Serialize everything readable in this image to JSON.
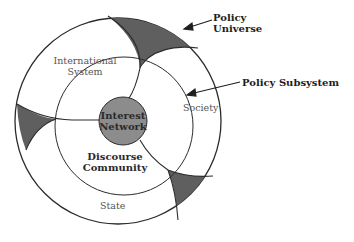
{
  "diagram": {
    "type": "nested-circles",
    "colors": {
      "background": "#ffffff",
      "line": "#2b2b2b",
      "wedge_fill": "#5f5f5f",
      "core_fill": "#8c8c8c",
      "label_regular": "#555555",
      "label_bold": "#2a2a2a"
    },
    "callouts": {
      "policy_universe": {
        "line1": "Policy",
        "line2": "Universe"
      },
      "policy_subsystem": "Policy Subsystem"
    },
    "regions": {
      "international_system": {
        "line1": "International",
        "line2": "System"
      },
      "society": "Society",
      "state": "State"
    },
    "core": {
      "line1": "Interest",
      "line2": "Network"
    },
    "discourse_community": {
      "line1": "Discourse",
      "line2": "Community"
    }
  }
}
